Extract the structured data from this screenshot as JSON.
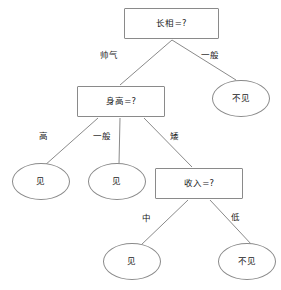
{
  "diagram": {
    "type": "decision-tree",
    "title": "",
    "nodes": [
      {
        "id": "root",
        "shape": "rect",
        "label": "长相=?",
        "x": 124,
        "y": 8,
        "w": 95,
        "h": 31
      },
      {
        "id": "height",
        "shape": "rect",
        "label": "身高=?",
        "x": 77,
        "y": 86,
        "w": 88,
        "h": 31
      },
      {
        "id": "income",
        "shape": "rect",
        "label": "收入=?",
        "x": 155,
        "y": 168,
        "w": 88,
        "h": 31
      },
      {
        "id": "leaf_r1",
        "shape": "ellipse",
        "label": "不见",
        "x": 212,
        "y": 80,
        "w": 58,
        "h": 37
      },
      {
        "id": "leaf_l1",
        "shape": "ellipse",
        "label": "见",
        "x": 12,
        "y": 163,
        "w": 58,
        "h": 37
      },
      {
        "id": "leaf_l2",
        "shape": "ellipse",
        "label": "见",
        "x": 88,
        "y": 163,
        "w": 58,
        "h": 37
      },
      {
        "id": "leaf_b1",
        "shape": "ellipse",
        "label": "见",
        "x": 103,
        "y": 243,
        "w": 58,
        "h": 37
      },
      {
        "id": "leaf_b2",
        "shape": "ellipse",
        "label": "不见",
        "x": 218,
        "y": 243,
        "w": 58,
        "h": 37
      }
    ],
    "edges": [
      {
        "from": "root",
        "to": "height",
        "label": "帅气",
        "lx": 100,
        "ly": 51
      },
      {
        "from": "root",
        "to": "leaf_r1",
        "label": "一般",
        "lx": 201,
        "ly": 51
      },
      {
        "from": "height",
        "to": "leaf_l1",
        "label": "高",
        "lx": 39,
        "ly": 132
      },
      {
        "from": "height",
        "to": "leaf_l2",
        "label": "一般",
        "lx": 93,
        "ly": 132
      },
      {
        "from": "height",
        "to": "income",
        "label": "矮",
        "lx": 170,
        "ly": 132
      },
      {
        "from": "income",
        "to": "leaf_b1",
        "label": "中",
        "lx": 142,
        "ly": 214
      },
      {
        "from": "income",
        "to": "leaf_b2",
        "label": "低",
        "lx": 231,
        "ly": 213
      }
    ],
    "lines": [
      {
        "name": "edge-root-to-height",
        "x1": 172,
        "y1": 40,
        "x2": 120,
        "y2": 85
      },
      {
        "name": "edge-root-to-no-meet",
        "x1": 172,
        "y1": 40,
        "x2": 236,
        "y2": 80
      },
      {
        "name": "edge-height-to-tall",
        "x1": 98,
        "y1": 118,
        "x2": 44,
        "y2": 166
      },
      {
        "name": "edge-height-to-avg",
        "x1": 120,
        "y1": 118,
        "x2": 119,
        "y2": 164
      },
      {
        "name": "edge-height-to-income",
        "x1": 144,
        "y1": 118,
        "x2": 192,
        "y2": 167
      },
      {
        "name": "edge-income-to-meet",
        "x1": 188,
        "y1": 200,
        "x2": 140,
        "y2": 246
      },
      {
        "name": "edge-income-to-nomeet",
        "x1": 210,
        "y1": 200,
        "x2": 252,
        "y2": 245
      }
    ],
    "colors": {
      "stroke": "#8a8a8a",
      "text": "#1a1a1a",
      "background": "#ffffff"
    }
  }
}
